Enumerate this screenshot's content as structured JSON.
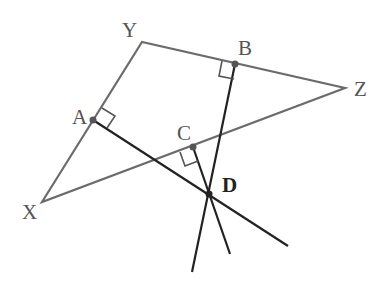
{
  "diagram": {
    "type": "geometry",
    "colors": {
      "triangle": "#6b6b6b",
      "perpendiculars": "#222222",
      "points": "#555555"
    },
    "labels": {
      "X": "X",
      "Y": "Y",
      "Z": "Z",
      "A": "A",
      "B": "B",
      "C": "C",
      "D": "D"
    },
    "vertices": {
      "X": [
        42,
        202
      ],
      "Y": [
        142,
        42
      ],
      "Z": [
        345,
        88
      ]
    },
    "midpoints": {
      "A": {
        "pos": [
          93,
          120
        ],
        "on_side": "XY"
      },
      "B": {
        "pos": [
          235,
          64
        ],
        "on_side": "YZ"
      },
      "C": {
        "pos": [
          193,
          147
        ],
        "on_side": "XZ"
      }
    },
    "intersection": {
      "D": [
        209,
        194
      ]
    },
    "right_angle_marks": [
      "A",
      "B",
      "C"
    ]
  }
}
